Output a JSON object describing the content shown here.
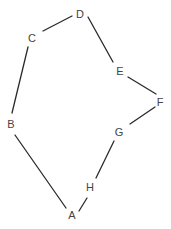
{
  "diagram": {
    "type": "polygon-graph",
    "nodes": [
      {
        "id": "A",
        "label": "A",
        "x": 72,
        "y": 215
      },
      {
        "id": "B",
        "label": "B",
        "x": 11,
        "y": 124
      },
      {
        "id": "C",
        "label": "C",
        "x": 32,
        "y": 38
      },
      {
        "id": "D",
        "label": "D",
        "x": 80,
        "y": 14
      },
      {
        "id": "E",
        "label": "E",
        "x": 120,
        "y": 71
      },
      {
        "id": "F",
        "label": "F",
        "x": 160,
        "y": 102
      },
      {
        "id": "G",
        "label": "G",
        "x": 119,
        "y": 132
      },
      {
        "id": "H",
        "label": "H",
        "x": 90,
        "y": 187
      }
    ],
    "edges": [
      {
        "from": "A",
        "to": "B",
        "x1": 66,
        "y1": 208,
        "x2": 15,
        "y2": 135
      },
      {
        "from": "B",
        "to": "C",
        "x1": 12,
        "y1": 113,
        "x2": 28,
        "y2": 47
      },
      {
        "from": "C",
        "to": "D",
        "x1": 43,
        "y1": 31,
        "x2": 72,
        "y2": 16
      },
      {
        "from": "D",
        "to": "E",
        "x1": 88,
        "y1": 17,
        "x2": 113,
        "y2": 62
      },
      {
        "from": "E",
        "to": "F",
        "x1": 128,
        "y1": 77,
        "x2": 156,
        "y2": 94
      },
      {
        "from": "F",
        "to": "G",
        "x1": 155,
        "y1": 107,
        "x2": 130,
        "y2": 124
      },
      {
        "from": "G",
        "to": "H",
        "x1": 114,
        "y1": 141,
        "x2": 96,
        "y2": 178
      },
      {
        "from": "H",
        "to": "A",
        "x1": 87,
        "y1": 198,
        "x2": 79,
        "y2": 211
      }
    ],
    "colors": {
      "edge": "#2a2a2a",
      "label": "#444444",
      "background": "#ffffff"
    }
  }
}
